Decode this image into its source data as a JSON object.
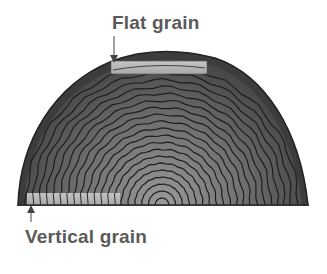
{
  "diagram": {
    "labels": {
      "flat_grain": "Flat grain",
      "vertical_grain": "Vertical grain"
    },
    "colors": {
      "bark": "#3a3a3a",
      "wood_outer": "#555555",
      "wood_inner": "#8a8a8a",
      "ring_line": "#1e1e1e",
      "board": "#b4b4b4",
      "label_text": "#5a5a5a"
    },
    "log": {
      "center_x": 162,
      "base_y": 205,
      "outer_radius_x": 146,
      "outer_radius_y": 155,
      "ring_count": 20
    },
    "boards": {
      "flat_grain": {
        "x": 111,
        "y": 61,
        "width": 96,
        "height": 13
      },
      "vertical_grain": {
        "x": 27,
        "y": 193,
        "width": 93,
        "height": 12
      }
    },
    "arrows": {
      "flat_grain": {
        "x": 114,
        "y1": 36,
        "y2": 62
      },
      "vertical_grain": {
        "x": 31,
        "y1": 222,
        "y2": 205
      }
    }
  }
}
